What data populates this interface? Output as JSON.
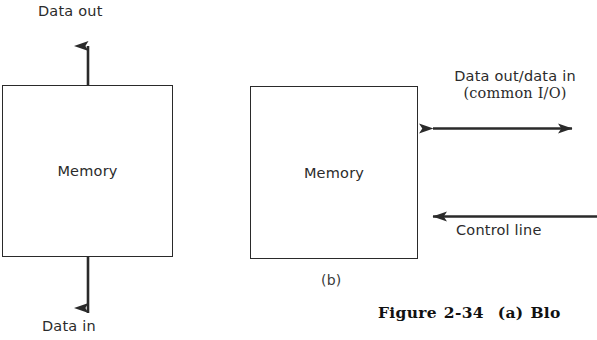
{
  "figure": {
    "caption_label": "Figure",
    "caption_number": "2-34",
    "caption_part": "(a)",
    "caption_text_truncated": "Blo"
  },
  "diagram_a": {
    "box_label": "Memory",
    "top_label": "Data out",
    "bottom_label": "Data in",
    "top_arrow": "arrow-up-out",
    "bottom_arrow": "arrow-up-in"
  },
  "diagram_b": {
    "sublabel": "(b)",
    "box_label": "Memory",
    "io_label_line1": "Data out/data in",
    "io_label_line2": "(common I/O)",
    "io_arrow": "arrow-bidirectional",
    "control_label": "Control line",
    "control_arrow": "arrow-left-in"
  },
  "colors": {
    "background": "#ffffff",
    "stroke": "#2a2a2a",
    "text": "#2b2b2b",
    "caption_text": "#111111"
  }
}
